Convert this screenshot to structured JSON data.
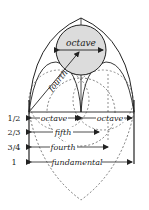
{
  "diagram": {
    "circle_label": "octave",
    "diagonal_label": "fourth",
    "ratios": [
      {
        "ratio": "1/2",
        "labels": [
          "octave",
          "octave"
        ]
      },
      {
        "ratio": "2/3",
        "labels": [
          "fifth"
        ]
      },
      {
        "ratio": "3/4",
        "labels": [
          "fourth"
        ]
      },
      {
        "ratio": "1",
        "labels": [
          "fundamental"
        ]
      }
    ],
    "colors": {
      "line": "#222222",
      "circle_fill": "#dcdcdc",
      "background": "#ffffff"
    }
  }
}
